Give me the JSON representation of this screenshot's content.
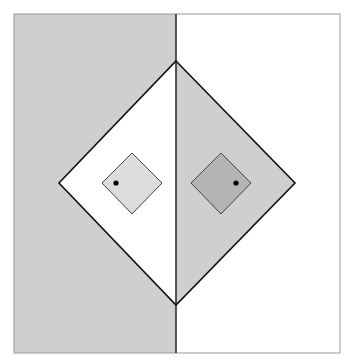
{
  "diagram": {
    "colors": {
      "background": "#ffffff",
      "gray_region": "#cfcfcf",
      "white_region": "#ffffff",
      "left_small_diamond": "#dcdcdc",
      "right_small_diamond": "#b4b4b4",
      "stroke": "#222222",
      "frame": "#999999",
      "dot": "#000000"
    },
    "frame": {
      "x": 14,
      "y": 14,
      "w": 326,
      "h": 339
    },
    "divider_x": 176,
    "big_diamond": {
      "top": [
        176,
        61
      ],
      "left": [
        59,
        183
      ],
      "right": [
        295,
        183
      ],
      "bottom": [
        176,
        305
      ]
    },
    "small_diamonds": [
      {
        "center": [
          132,
          183
        ],
        "half": 30,
        "dot": [
          116,
          183
        ]
      },
      {
        "center": [
          221,
          183
        ],
        "half": 30,
        "dot": [
          236,
          183
        ]
      }
    ]
  }
}
